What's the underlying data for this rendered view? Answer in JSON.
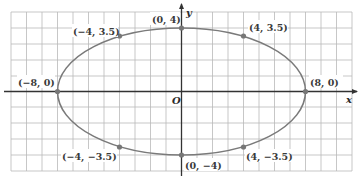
{
  "diagram": {
    "type": "ellipse-on-grid",
    "axes": {
      "x_label": "x",
      "y_label": "y",
      "origin_label": "O"
    },
    "ellipse": {
      "semi_major_x": 8,
      "semi_minor_y": 4,
      "color": "#7a7a7a"
    },
    "points": [
      {
        "label": "(0, 4)",
        "x": 0,
        "y": 4
      },
      {
        "label": "(−4, 3.5)",
        "x": -4,
        "y": 3.5
      },
      {
        "label": "(4, 3.5)",
        "x": 4,
        "y": 3.5
      },
      {
        "label": "(−8, 0)",
        "x": -8,
        "y": 0
      },
      {
        "label": "(8, 0)",
        "x": 8,
        "y": 0
      },
      {
        "label": "(−4, −3.5)",
        "x": -4,
        "y": -3.5
      },
      {
        "label": "(0, −4)",
        "x": 0,
        "y": -4
      },
      {
        "label": "(4, −3.5)",
        "x": 4,
        "y": -3.5
      }
    ],
    "grid": {
      "x_range": [
        -11,
        11
      ],
      "y_range": [
        -5,
        5
      ],
      "line_color": "#bdbdbd"
    }
  }
}
